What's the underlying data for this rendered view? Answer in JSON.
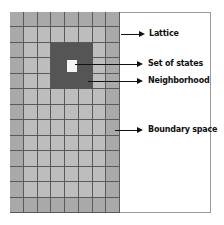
{
  "diagram": {
    "type": "cellular-automaton-lattice",
    "grid": {
      "columns": 8,
      "rows": 13,
      "neighborhood": {
        "col_start": 3,
        "row_start": 2,
        "size": 3
      },
      "center_cell": {
        "col": 4,
        "row": 3
      }
    },
    "colors": {
      "boundary_cell": "#a9a9a9",
      "inner_cell": "#bdbdbd",
      "neighborhood": "#555555",
      "center_cell": "#f4f4f4",
      "grid_line": "#5a5a5a",
      "arrow": "#111111"
    },
    "labels": {
      "lattice": "Lattice",
      "set_of_states": "Set of states",
      "neighborhood": "Neighborhood",
      "boundary_space": "Boundary space"
    }
  }
}
